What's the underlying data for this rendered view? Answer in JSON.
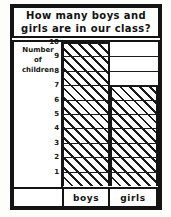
{
  "title": {
    "line1": "How many boys and",
    "line2": "girls are in our class?",
    "full": "How many boys and girls are in our class?"
  },
  "axis_caption": {
    "line1": "Number",
    "line2": "of",
    "line3": "children"
  },
  "labels": {
    "boys": "boys",
    "girls": "girls"
  },
  "ticks": {
    "t10": "10",
    "t9": "9",
    "t8": "8",
    "t7": "7",
    "t6": "6",
    "t5": "5",
    "t4": "4",
    "t3": "3",
    "t2": "2",
    "t1": "1"
  },
  "colors": {
    "ink": "#141414",
    "paper": "#ffffff"
  },
  "chart_data": {
    "type": "bar",
    "title": "How many boys and girls are in our class?",
    "categories": [
      "boys",
      "girls"
    ],
    "values": [
      10,
      7
    ],
    "xlabel": "",
    "ylabel": "Number of children",
    "ylim": [
      0,
      10
    ],
    "ytick_labels": [
      "1",
      "2",
      "3",
      "4",
      "5",
      "6",
      "7",
      "8",
      "9",
      "10"
    ],
    "grid": true,
    "legend": "none",
    "bar_fill": "diagonal-hatch"
  }
}
